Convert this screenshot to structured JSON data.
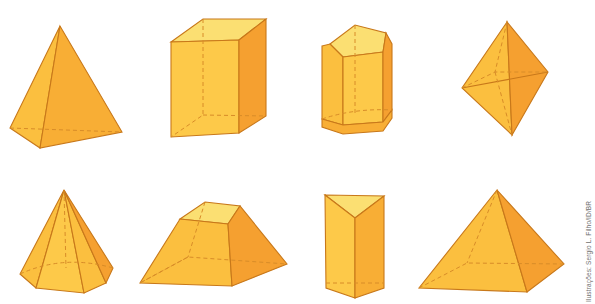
{
  "figure": {
    "background_color": "#ffffff",
    "palette": {
      "face_top_light": "#fbdf72",
      "face_light": "#fdc949",
      "face_mid": "#fbbf3f",
      "face_dark": "#f5a030",
      "face_darker": "#ef9326",
      "edge": "#c8781a",
      "edge_hidden": "#d88c28",
      "credit_color": "#6f6f6f"
    },
    "credit": "Ilustrações: Sergio L. Filho/ID/BR",
    "rows": [
      {
        "row_index": 1,
        "shapes": [
          {
            "id": "tetrahedron",
            "label": "Tetrahedron",
            "faces": 4,
            "position": "top-left"
          },
          {
            "id": "rectangular-prism",
            "label": "Rectangular prism",
            "faces": 6,
            "position": "top-center-left"
          },
          {
            "id": "pentagonal-prism",
            "label": "Pentagonal prism",
            "faces": 7,
            "position": "top-center-right"
          },
          {
            "id": "octahedron",
            "label": "Octahedron",
            "faces": 8,
            "position": "top-right"
          }
        ]
      },
      {
        "row_index": 2,
        "shapes": [
          {
            "id": "pentagonal-pyramid",
            "label": "Pentagonal pyramid",
            "faces": 6,
            "position": "bottom-left"
          },
          {
            "id": "truncated-pyramid",
            "label": "Truncated pyramid (frustum)",
            "faces": 6,
            "position": "bottom-center-left"
          },
          {
            "id": "triangular-prism",
            "label": "Triangular prism",
            "faces": 5,
            "position": "bottom-center-right"
          },
          {
            "id": "square-pyramid",
            "label": "Square pyramid",
            "faces": 5,
            "position": "bottom-right"
          }
        ]
      }
    ]
  }
}
